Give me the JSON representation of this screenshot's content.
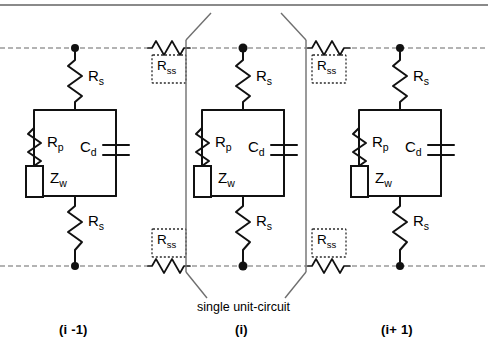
{
  "figure": {
    "title_bar_color": "#8a8a8a",
    "rail_color": "#9a9a9a",
    "wire_color": "#111111",
    "background": "#ffffff"
  },
  "rails": {
    "top_label": "top-bus-rail",
    "bottom_label": "bottom-bus-rail",
    "style": "dotted"
  },
  "bracket": {
    "label": "single unit-circuit"
  },
  "cells": [
    {
      "id": "cell-i-minus-1",
      "label": "(i -1)",
      "x": 75,
      "components": {
        "rs_top": "R",
        "rs_top_sub": "s",
        "rp": "R",
        "rp_sub": "p",
        "zw": "Z",
        "zw_sub": "w",
        "cd": "C",
        "cd_sub": "d",
        "rs_bottom": "R",
        "rs_bottom_sub": "s"
      }
    },
    {
      "id": "cell-i",
      "label": "(i)",
      "x": 243,
      "components": {
        "rs_top": "R",
        "rs_top_sub": "s",
        "rp": "R",
        "rp_sub": "p",
        "zw": "Z",
        "zw_sub": "w",
        "cd": "C",
        "cd_sub": "d",
        "rs_bottom": "R",
        "rs_bottom_sub": "s"
      }
    },
    {
      "id": "cell-i-plus-1",
      "label": "(i+ 1)",
      "x": 400,
      "components": {
        "rs_top": "R",
        "rs_top_sub": "s",
        "rp": "R",
        "rp_sub": "p",
        "zw": "Z",
        "zw_sub": "w",
        "cd": "C",
        "cd_sub": "d",
        "rs_bottom": "R",
        "rs_bottom_sub": "s"
      }
    }
  ],
  "series_resistors": [
    {
      "id": "rss-top-left",
      "base": "R",
      "sub": "ss",
      "x": 170,
      "y": 48
    },
    {
      "id": "rss-top-right",
      "base": "R",
      "sub": "ss",
      "x": 330,
      "y": 48
    },
    {
      "id": "rss-bottom-left",
      "base": "R",
      "sub": "ss",
      "x": 170,
      "y": 266
    },
    {
      "id": "rss-bottom-right",
      "base": "R",
      "sub": "ss",
      "x": 330,
      "y": 266
    }
  ]
}
